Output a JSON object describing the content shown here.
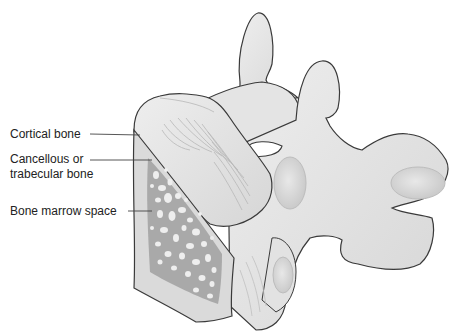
{
  "diagram": {
    "labels": [
      {
        "id": "cortical",
        "text": "Cortical bone",
        "x": 10,
        "y": 128
      },
      {
        "id": "cancellous",
        "line1": "Cancellous or",
        "line2": "trabecular bone",
        "x": 10,
        "y": 153
      },
      {
        "id": "marrow",
        "text": "Bone marrow space",
        "x": 10,
        "y": 204
      }
    ],
    "colors": {
      "bone_fill": "#e6e6e6",
      "bone_shade": "#d2d2d2",
      "cut_face": "#d9d9d9",
      "trabecular": "#a9a9a9",
      "marrow_holes": "#eeeeee",
      "outline": "#3a3a3a",
      "leader_line": "#444444",
      "text": "#222222"
    }
  }
}
